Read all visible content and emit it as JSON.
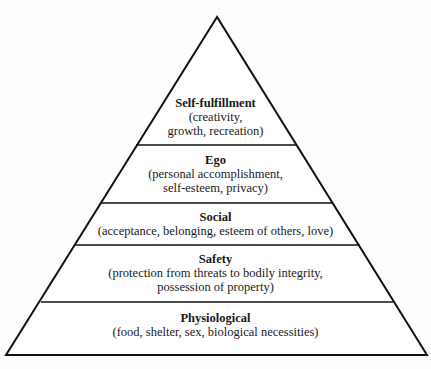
{
  "diagram": {
    "type": "pyramid",
    "colors": {
      "stroke": "#111111",
      "fill": "#ffffff"
    },
    "layers": [
      {
        "title": "Self-fulfillment",
        "description": [
          "(creativity,",
          "growth, recreation)"
        ]
      },
      {
        "title": "Ego",
        "description": [
          "(personal accomplishment,",
          "self-esteem, privacy)"
        ]
      },
      {
        "title": "Social",
        "description": [
          "(acceptance, belonging, esteem of others, love)"
        ]
      },
      {
        "title": "Safety",
        "description": [
          "(protection from threats to bodily integrity,",
          "possession of property)"
        ]
      },
      {
        "title": "Physiological",
        "description": [
          "(food, shelter, sex, biological necessities)"
        ]
      }
    ]
  }
}
